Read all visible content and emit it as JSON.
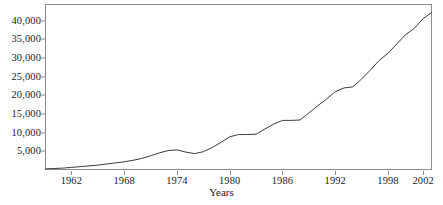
{
  "chart_data": {
    "type": "line",
    "title": "",
    "xlabel": "Years",
    "ylabel": "",
    "grid": false,
    "legend": false,
    "xlim": [
      1959,
      2003
    ],
    "ylim": [
      0,
      44500
    ],
    "x_tick_labels": [
      "1962",
      "1968",
      "1974",
      "1980",
      "1986",
      "1992",
      "1998",
      "2002"
    ],
    "x_ticks": [
      1962,
      1968,
      1974,
      1980,
      1986,
      1992,
      1998,
      2002
    ],
    "y_tick_labels": [
      "5,000",
      "10,000",
      "15,000",
      "20,000",
      "25,000",
      "30,000",
      "35,000",
      "40,000"
    ],
    "y_ticks": [
      5000,
      10000,
      15000,
      20000,
      25000,
      30000,
      35000,
      40000
    ],
    "series": [
      {
        "name": "series-1",
        "color": "#3b3b3b",
        "x": [
          1959,
          1960,
          1961,
          1962,
          1963,
          1964,
          1965,
          1966,
          1967,
          1968,
          1969,
          1970,
          1971,
          1972,
          1973,
          1974,
          1975,
          1976,
          1977,
          1978,
          1979,
          1980,
          1981,
          1982,
          1983,
          1984,
          1985,
          1986,
          1987,
          1988,
          1989,
          1990,
          1991,
          1992,
          1993,
          1994,
          1995,
          1996,
          1997,
          1998,
          1999,
          2000,
          2001,
          2002,
          2003
        ],
        "values": [
          300,
          400,
          500,
          700,
          900,
          1100,
          1300,
          1600,
          1900,
          2200,
          2600,
          3100,
          3800,
          4600,
          5200,
          5400,
          4800,
          4400,
          4900,
          6000,
          7400,
          8900,
          9500,
          9500,
          9600,
          11000,
          12300,
          13300,
          13300,
          13400,
          15300,
          17200,
          19000,
          21000,
          22000,
          22300,
          24400,
          26800,
          29400,
          31300,
          33800,
          36300,
          38000,
          40600,
          42300
        ]
      }
    ]
  },
  "axis": {
    "y_title": "",
    "x_title": "Years"
  },
  "colors": {
    "line": "#3b3b3b",
    "frame": "#8d8d8d",
    "background": "#ffffff",
    "text": "#1a1a1a"
  }
}
